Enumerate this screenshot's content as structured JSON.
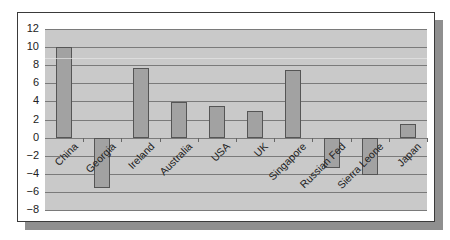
{
  "chart_data": {
    "type": "bar",
    "title": "",
    "xlabel": "",
    "ylabel": "",
    "categories": [
      "China",
      "Georgia",
      "Ireland",
      "Australia",
      "USA",
      "UK",
      "Singapore",
      "Russian Fed",
      "Sierra Leone",
      "Japan"
    ],
    "values": [
      10.0,
      -5.6,
      7.7,
      3.9,
      3.5,
      2.9,
      7.5,
      -3.4,
      -4.1,
      1.5
    ],
    "ylim": [
      -8,
      12
    ],
    "yticks": [
      12,
      10,
      8,
      6,
      4,
      2,
      0,
      -2,
      -4,
      -6,
      -8
    ],
    "ytick_labels": [
      "12",
      "10",
      "8",
      "6",
      "4",
      "2",
      "0",
      "−2",
      "−4",
      "−6",
      "−8"
    ],
    "grid": true,
    "legend": null
  },
  "colors": {
    "plot_bg": "#c9c9c9",
    "bar_fill": "#a2a2a2",
    "bar_border": "#555555",
    "gridline": "#7a7a7a",
    "shadow": "#8f8f8f"
  }
}
